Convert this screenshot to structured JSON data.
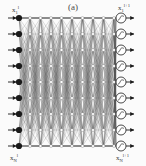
{
  "figure": {
    "caption": "(a)",
    "type": "neural-network-diagram",
    "background_color": "#fbfbfb",
    "ink_color": "#1a1a1a",
    "mesh_color": "#555555",
    "width": 146,
    "height": 166
  },
  "labels": {
    "input_top": {
      "base": "x",
      "sub": "1",
      "sup": "l"
    },
    "input_bottom": {
      "base": "x",
      "sub": "N",
      "sup": "l"
    },
    "output_top": {
      "base": "x",
      "sub": "1",
      "sup": "l+1"
    },
    "output_bottom": {
      "base": "x",
      "sub": "N",
      "sup": "l+1"
    }
  },
  "network": {
    "input_layer": {
      "name": "input-nodes",
      "count": 9,
      "node_style": "filled-dot",
      "x": 19,
      "y_start": 18,
      "y_step": 16,
      "radius": 3.1,
      "has_incoming_arrow": true
    },
    "hidden_mesh": {
      "name": "fully-connected-mesh",
      "columns": 9,
      "rows": 9,
      "x_start": 30,
      "x_end": 114,
      "y_start": 18,
      "y_step": 16,
      "line_width": 0.38,
      "node_radius": 1.5
    },
    "output_layer": {
      "name": "output-nodes",
      "count": 9,
      "node_style": "circle-with-activation",
      "x": 121,
      "y_start": 18,
      "y_step": 16,
      "radius": 5.0,
      "glyph": "sigmoid-activation",
      "has_outgoing_arrow": true
    }
  },
  "chart_data": {
    "type": "diagram",
    "title": "(a)",
    "layers": [
      {
        "name": "input",
        "nodes": 9,
        "marker": "filled-dot"
      },
      {
        "name": "hidden",
        "nodes": 9,
        "marker": "small-dot"
      },
      {
        "name": "output",
        "nodes": 9,
        "marker": "circle-activation"
      }
    ],
    "connectivity": "fully-connected",
    "xlabel": "",
    "ylabel": "",
    "legend": []
  }
}
